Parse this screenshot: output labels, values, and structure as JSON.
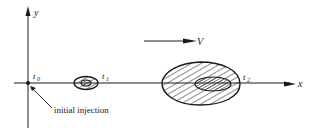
{
  "diagram": {
    "axes": {
      "x_label": "x",
      "y_label": "y"
    },
    "velocity": {
      "label": "V"
    },
    "time_labels": {
      "t0": "t",
      "t0_sub": "0",
      "t1": "t",
      "t1_sub": "1",
      "t2": "t",
      "t2_sub": "2"
    },
    "annotation": {
      "text": "initial  injection"
    },
    "colors": {
      "ink": "#1a1a1a",
      "background": "#ffffff"
    }
  }
}
